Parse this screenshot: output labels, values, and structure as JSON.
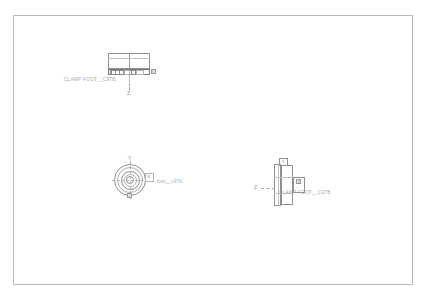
{
  "app": {
    "background_color": "#ffffff",
    "frame_color": "#b9b9b9",
    "line_color": "#8f8f8f"
  },
  "sheet": {
    "name": "drawing-sheet"
  },
  "views": {
    "top": {
      "part_label": "CLAMP-FOOT__C97B",
      "axis_tag_right": "X",
      "axis_label_bottom": "Z"
    },
    "front": {
      "part_label": "...foot__c97b",
      "axis_label_top": "Y",
      "axis_tag_right": "X",
      "axis_tag_bottom": "Z"
    },
    "side": {
      "part_label": "CLAMP-FOOT__C97B",
      "axis_label_left": "Z",
      "axis_tag_top": "Y",
      "axis_tag_right": "X"
    }
  }
}
